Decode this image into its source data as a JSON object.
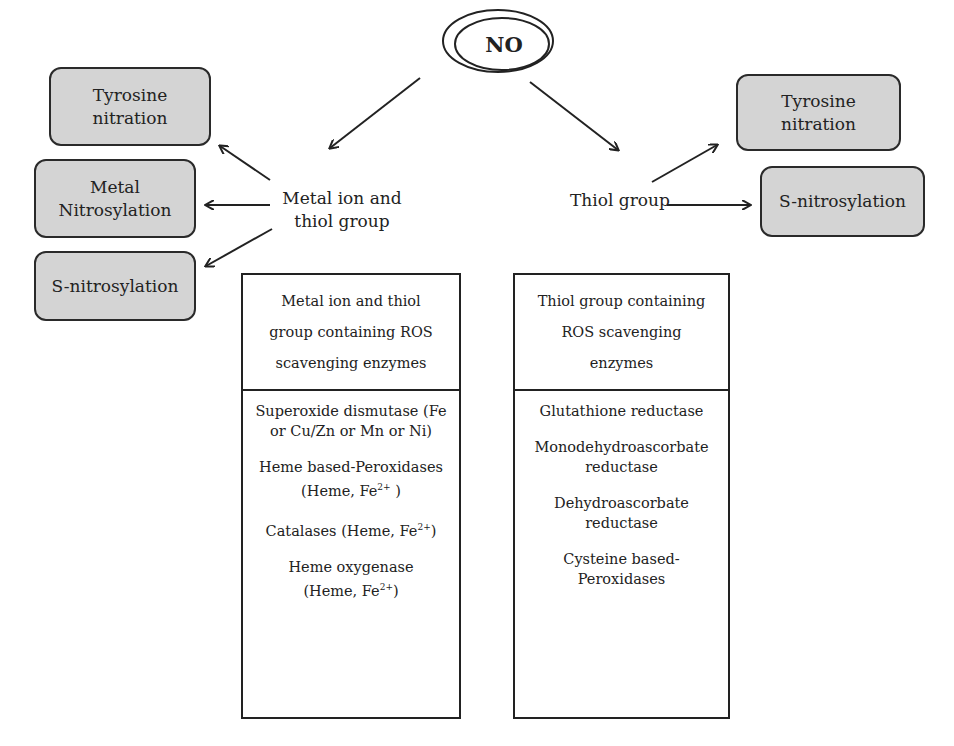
{
  "center_node": "NO",
  "branches": {
    "left": {
      "label": "Metal ion and thiol group",
      "label_lines": [
        "Metal ion and",
        "thiol group"
      ],
      "targets": [
        {
          "lines": [
            "Tyrosine",
            "nitration"
          ]
        },
        {
          "lines": [
            "Metal",
            "Nitrosylation"
          ]
        },
        {
          "lines": [
            "S-nitrosylation"
          ]
        }
      ],
      "table": {
        "header_lines": [
          "Metal ion and thiol",
          "group containing ROS",
          "scavenging enzymes"
        ],
        "items": [
          {
            "text": "Superoxide dismutase (Fe or Cu/Zn or Mn or Ni)"
          },
          {
            "text": "Heme based-Peroxidases (Heme, Fe",
            "sup": "2+",
            "tail": " )"
          },
          {
            "text": "Catalases (Heme, Fe",
            "sup": "2+",
            "tail": ")"
          },
          {
            "text": "Heme oxygenase (Heme, Fe",
            "sup": "2+",
            "tail": ")"
          }
        ]
      }
    },
    "right": {
      "label": "Thiol group",
      "targets": [
        {
          "lines": [
            "Tyrosine",
            "nitration"
          ]
        },
        {
          "lines": [
            "S-nitrosylation"
          ]
        }
      ],
      "table": {
        "header_lines": [
          "Thiol group containing",
          "ROS scavenging",
          "enzymes"
        ],
        "items": [
          {
            "text": "Glutathione reductase"
          },
          {
            "text": "Monodehydroascorbate reductase"
          },
          {
            "text": "Dehydroascorbate reductase"
          },
          {
            "text": "Cysteine based-Peroxidases"
          }
        ]
      }
    }
  },
  "colors": {
    "box_fill": "#d4d4d4",
    "stroke": "#222222"
  }
}
